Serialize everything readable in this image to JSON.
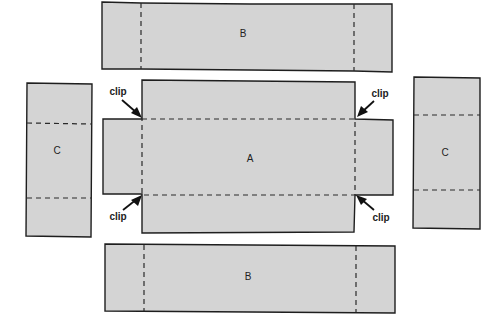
{
  "diagram": {
    "type": "sewing/box pattern layout",
    "colors": {
      "piece_fill": "#d4d4d4",
      "outline": "#1e1e1e",
      "background": "#ffffff"
    },
    "pieces": [
      {
        "id": "B-top",
        "label": "B",
        "fold_lines": "vertical dashed, near each end"
      },
      {
        "id": "A",
        "label": "A",
        "fold_lines": "dashed rectangle around center base"
      },
      {
        "id": "C-left",
        "label": "C",
        "fold_lines": "horizontal dashed, near each end"
      },
      {
        "id": "C-right",
        "label": "C",
        "fold_lines": "horizontal dashed, near each end"
      },
      {
        "id": "B-bottom",
        "label": "B",
        "fold_lines": "vertical dashed, near each end"
      }
    ],
    "annotations": [
      {
        "id": "clip-top-left",
        "text": "clip"
      },
      {
        "id": "clip-top-right",
        "text": "clip"
      },
      {
        "id": "clip-bottom-left",
        "text": "clip"
      },
      {
        "id": "clip-bottom-right",
        "text": "clip"
      }
    ]
  }
}
